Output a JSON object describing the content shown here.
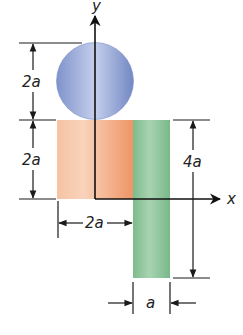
{
  "figure": {
    "axes": {
      "x_label": "x",
      "y_label": "y"
    },
    "shapes": {
      "circle": {
        "name": "circle",
        "diameter": "2a",
        "color": "#8fa3d6"
      },
      "square": {
        "name": "square",
        "width": "2a",
        "height": "2a",
        "color": "#f0a57c"
      },
      "rectangle": {
        "name": "rectangle",
        "width": "a",
        "height": "4a",
        "color": "#8cc49a"
      }
    },
    "dimensions": {
      "circle_height": "2a",
      "square_height": "2a",
      "rectangle_height": "4a",
      "square_width": "2a",
      "rectangle_width": "a"
    }
  }
}
